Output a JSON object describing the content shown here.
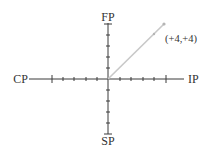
{
  "diagram": {
    "type": "quadrant-axes",
    "axes": {
      "left_label": "CP",
      "right_label": "IP",
      "top_label": "FP",
      "bottom_label": "SP",
      "range": [
        -5,
        5
      ],
      "ticks_each_side": 5
    },
    "vector": {
      "from": [
        0,
        0
      ],
      "to_label": "(+4,+4)",
      "point": [
        4,
        4
      ]
    },
    "colors": {
      "axis": "#3a3a3a",
      "vector": "#c8c8c8",
      "text": "#333333"
    }
  }
}
